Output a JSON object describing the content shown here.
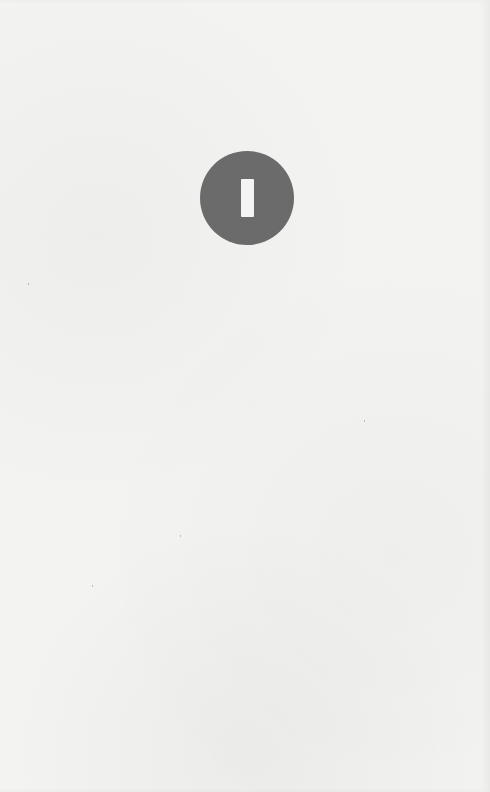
{
  "page": {
    "background_color": "#f3f3f1"
  },
  "badge": {
    "icon": "vertical-bar-icon",
    "glyph": "I",
    "fill_color": "#6b6b6b",
    "bar_color": "#f4f4f4"
  }
}
